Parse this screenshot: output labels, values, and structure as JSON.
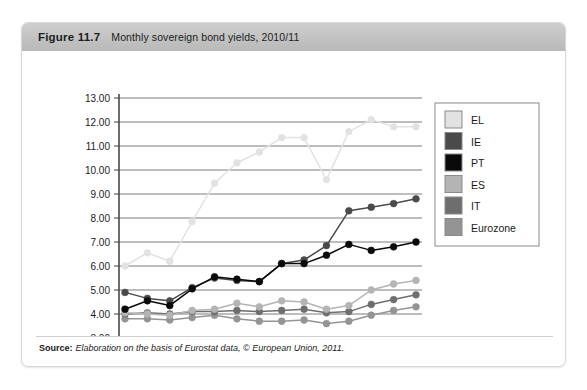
{
  "figure": {
    "number": "Figure 11.7",
    "title": "Monthly sovereign bond yields, 2010/11",
    "source_label": "Source:",
    "source_text": "Elaboration on the basis of Eurostat data, © European Union, 2011."
  },
  "colors": {
    "header_bar": "#c4c4c4",
    "box_border": "#d8d8d8",
    "gridline": "#6e6e6e",
    "axis": "#4a4a4a",
    "legend_border": "#8a8a8a",
    "EL": "#e2e2e2",
    "IE": "#4a4a4a",
    "PT": "#0a0a0a",
    "ES": "#b4b4b4",
    "IT": "#6e6e6e",
    "Eurozone": "#949494"
  },
  "chart_data": {
    "type": "line",
    "title": "Monthly sovereign bond yields, 2010/11",
    "xlabel": "",
    "ylabel": "",
    "ylim": [
      3.0,
      13.0
    ],
    "ytick_step": 1.0,
    "grid": true,
    "legend_position": "right",
    "ytick_labels": [
      "13.00",
      "12.00",
      "11.00",
      "10.00",
      "9.00",
      "8.00",
      "7.00",
      "6.00",
      "5.00",
      "4.00",
      "3.00"
    ],
    "yticks": [
      13.0,
      12.0,
      11.0,
      10.0,
      9.0,
      8.0,
      7.0,
      6.0,
      5.0,
      4.0,
      3.0
    ],
    "x_axis_labels": [
      "2010/11",
      "2011/12"
    ],
    "x_tick_count": 14,
    "x": [
      1,
      2,
      3,
      4,
      5,
      6,
      7,
      8,
      9,
      10,
      11,
      12,
      13,
      14
    ],
    "series": [
      {
        "name": "EL",
        "color": "#e2e2e2",
        "values": [
          6.0,
          6.55,
          6.2,
          7.85,
          9.45,
          10.3,
          10.75,
          11.35,
          11.35,
          9.6,
          11.6,
          12.1,
          11.8,
          11.8
        ]
      },
      {
        "name": "IE",
        "color": "#4a4a4a",
        "values": [
          4.9,
          4.65,
          4.55,
          5.1,
          5.5,
          5.4,
          5.35,
          6.1,
          6.25,
          6.85,
          8.3,
          8.45,
          8.6,
          8.8
        ]
      },
      {
        "name": "PT",
        "color": "#0a0a0a",
        "values": [
          4.2,
          4.55,
          4.35,
          5.05,
          5.55,
          5.45,
          5.35,
          6.1,
          6.1,
          6.45,
          6.9,
          6.65,
          6.8,
          7.0
        ]
      },
      {
        "name": "ES",
        "color": "#b4b4b4",
        "values": [
          4.05,
          4.0,
          3.95,
          4.15,
          4.2,
          4.45,
          4.3,
          4.55,
          4.5,
          4.2,
          4.35,
          5.0,
          5.25,
          5.4
        ]
      },
      {
        "name": "IT",
        "color": "#6e6e6e",
        "values": [
          4.0,
          4.05,
          4.0,
          4.1,
          4.1,
          4.15,
          4.1,
          4.15,
          4.2,
          4.05,
          4.1,
          4.4,
          4.6,
          4.8
        ]
      },
      {
        "name": "Eurozone",
        "color": "#949494",
        "values": [
          3.8,
          3.8,
          3.75,
          3.85,
          3.95,
          3.8,
          3.7,
          3.7,
          3.75,
          3.6,
          3.7,
          3.95,
          4.15,
          4.3
        ]
      }
    ],
    "legend_entries": [
      {
        "label": "EL",
        "color": "#e2e2e2"
      },
      {
        "label": "IE",
        "color": "#4a4a4a"
      },
      {
        "label": "PT",
        "color": "#0a0a0a"
      },
      {
        "label": "ES",
        "color": "#b4b4b4"
      },
      {
        "label": "IT",
        "color": "#6e6e6e"
      },
      {
        "label": "Eurozone",
        "color": "#949494"
      }
    ]
  }
}
